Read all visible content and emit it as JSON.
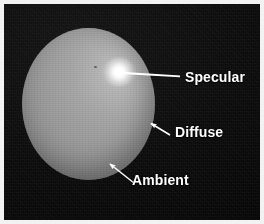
{
  "figure": {
    "background_color": "#0a0a0a",
    "border_color": "#f2f2f2",
    "width": 264,
    "height": 224
  },
  "sphere": {
    "name": "shaded-sphere",
    "base_color": "#9a9a9a",
    "highlight_color": "#ffffff",
    "shadow_color": "#6f6f6f",
    "center_x": 88,
    "center_y": 104,
    "radius_x": 66,
    "radius_y": 76
  },
  "specular_highlight": {
    "name": "specular-highlight",
    "color": "#ffffff",
    "center_x": 119,
    "center_y": 72
  },
  "callouts": [
    {
      "id": "specular",
      "label": "Specular",
      "line_from_x": 122,
      "line_from_y": 72,
      "line_to_x": 179,
      "line_to_y": 76,
      "arrow": false,
      "color": "#ffffff"
    },
    {
      "id": "diffuse",
      "label": "Diffuse",
      "line_from_x": 169,
      "line_from_y": 134,
      "line_to_x": 148,
      "line_to_y": 122,
      "arrow": true,
      "color": "#ffffff"
    },
    {
      "id": "ambient",
      "label": "Ambient",
      "line_from_x": 133,
      "line_from_y": 182,
      "line_to_x": 108,
      "line_to_y": 163,
      "arrow": true,
      "color": "#ffffff"
    }
  ]
}
